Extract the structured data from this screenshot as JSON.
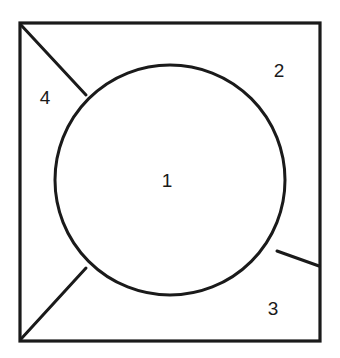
{
  "figure": {
    "kind": "geometric-diagram",
    "background_color": "#ffffff",
    "stroke_color": "#1a1a1a",
    "label_color": "#1a1a1a",
    "canvas": {
      "width": 340,
      "height": 358
    },
    "square": {
      "name": "outer-square",
      "x": 20,
      "y": 23,
      "width": 300,
      "height": 318,
      "stroke_width": 3.2
    },
    "circle": {
      "name": "inscribed-circle",
      "cx": 170,
      "cy": 180,
      "r": 115,
      "stroke_width": 3.0
    },
    "lines": [
      {
        "name": "line-top-left-corner-to-circle",
        "x1": 21,
        "y1": 25,
        "x2": 86,
        "y2": 95,
        "stroke_width": 3.0
      },
      {
        "name": "line-bottom-left-corner-to-circle",
        "x1": 21,
        "y1": 339,
        "x2": 86,
        "y2": 268,
        "stroke_width": 3.0
      },
      {
        "name": "line-circle-to-right-edge",
        "x1": 277,
        "y1": 251,
        "x2": 319,
        "y2": 266,
        "stroke_width": 3.0
      }
    ],
    "labels": [
      {
        "name": "region-label-1",
        "text": "1",
        "x": 167,
        "y": 180,
        "region": "circle-interior"
      },
      {
        "name": "region-label-2",
        "text": "2",
        "x": 279,
        "y": 70,
        "region": "upper-right-outside-circle"
      },
      {
        "name": "region-label-3",
        "text": "3",
        "x": 273,
        "y": 308,
        "region": "lower-right-outside-circle"
      },
      {
        "name": "region-label-4",
        "text": "4",
        "x": 45,
        "y": 97,
        "region": "upper-left-wedge"
      }
    ]
  }
}
